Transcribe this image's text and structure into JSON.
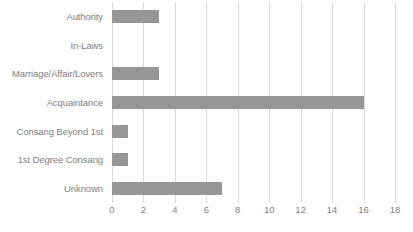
{
  "chart_data": {
    "type": "bar",
    "orientation": "horizontal",
    "title": "",
    "subtitle": "",
    "xlabel": "",
    "ylabel": "",
    "categories": [
      "Authority",
      "In-Laws",
      "Marriage/Affair/Lovers",
      "Acquaintance",
      "Consang Beyond 1st",
      "1st Degree Consang",
      "Unknown"
    ],
    "values": [
      3,
      0,
      3,
      16,
      1,
      1,
      7
    ],
    "xlim": [
      0,
      18
    ],
    "xticks": [
      0,
      2,
      4,
      6,
      8,
      10,
      12,
      14,
      16,
      18
    ],
    "xtick_labels": [
      "0",
      "2",
      "4",
      "6",
      "8",
      "10",
      "12",
      "14",
      "16",
      "18"
    ],
    "grid": true,
    "grid_axis": "x",
    "legend": false,
    "legend_position": "none",
    "annotations": [],
    "colors": {
      "bar": "#969696",
      "gridline": "#d9d9d9",
      "text": "#7f7f7f",
      "background": "#ffffff"
    }
  }
}
